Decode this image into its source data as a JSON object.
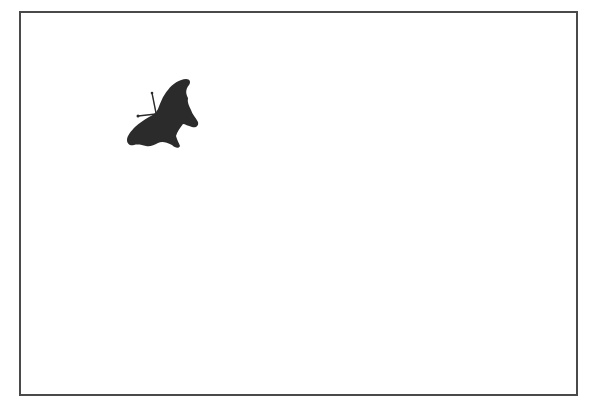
{
  "canvas": {
    "width": 594,
    "height": 417,
    "background": "#ffffff"
  },
  "frame": {
    "border_color": "#4a4a4a"
  },
  "figure": {
    "fill": "#2b2b2b"
  }
}
